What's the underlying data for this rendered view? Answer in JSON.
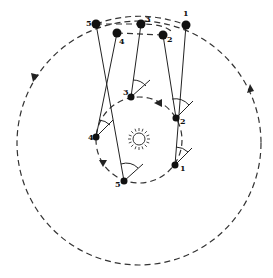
{
  "diagram": {
    "sun": {
      "icon": "sun-icon",
      "cx": 139,
      "cy": 139,
      "r": 6
    },
    "inner_orbit": {
      "cx": 139,
      "cy": 140,
      "r": 43,
      "arrow_positions": [
        [
          158,
          103
        ],
        [
          103,
          163
        ]
      ]
    },
    "outer_orbit": {
      "cx": 139,
      "cy": 143,
      "r": 122,
      "arrow_positions": [
        [
          35,
          77
        ],
        [
          250,
          89
        ]
      ]
    },
    "earth_positions": [
      {
        "label": "1",
        "x": 175,
        "y": 165
      },
      {
        "label": "2",
        "x": 176,
        "y": 118
      },
      {
        "label": "3",
        "x": 131,
        "y": 97
      },
      {
        "label": "4",
        "x": 96,
        "y": 137
      },
      {
        "label": "5",
        "x": 124,
        "y": 181
      }
    ],
    "planet_positions": [
      {
        "label": "1",
        "x": 186,
        "y": 25
      },
      {
        "label": "2",
        "x": 163,
        "y": 35
      },
      {
        "label": "3",
        "x": 141,
        "y": 24
      },
      {
        "label": "4",
        "x": 117,
        "y": 33
      },
      {
        "label": "5",
        "x": 96,
        "y": 24
      }
    ],
    "apparent_path": "dashed loop 5-3-1 over top, 4-2 below"
  }
}
